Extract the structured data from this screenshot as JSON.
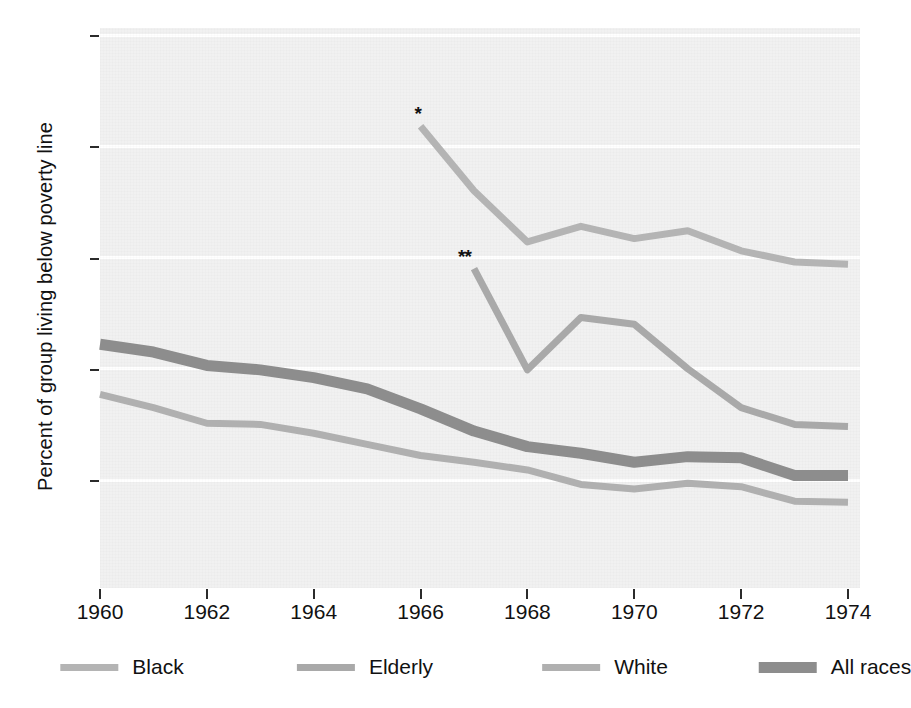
{
  "chart_data": {
    "type": "line",
    "title": "",
    "subtitle": "",
    "xlabel": "",
    "ylabel": "Percent of group living below poverty line",
    "xlim": [
      1960,
      1974
    ],
    "ylim": [
      0,
      50
    ],
    "grid": true,
    "grid_axis": "y",
    "legend_position": "bottom",
    "y_ticks": [
      10,
      20,
      30,
      40,
      50
    ],
    "y_tick_labels": [
      "10",
      "20",
      "30",
      "40",
      "50"
    ],
    "x_ticks": [
      1960,
      1962,
      1964,
      1966,
      1968,
      1970,
      1972,
      1974
    ],
    "x_tick_labels": [
      "1960",
      "1962",
      "1964",
      "1966",
      "1968",
      "1970",
      "1972",
      "1974"
    ],
    "annotations": [
      {
        "text": "*",
        "x": 1966,
        "y": 41.8,
        "note": "start of Black series"
      },
      {
        "text": "**",
        "x": 1967,
        "y": 29.0,
        "note": "start of Elderly series"
      }
    ],
    "series": [
      {
        "name": "Black",
        "color": "#b4b4b4",
        "width": 7,
        "x": [
          1966,
          1967,
          1968,
          1969,
          1970,
          1971,
          1972,
          1973,
          1974
        ],
        "values": [
          41.8,
          36.0,
          31.4,
          32.8,
          31.7,
          32.4,
          30.6,
          29.6,
          29.4
        ]
      },
      {
        "name": "Elderly",
        "color": "#a9a9a9",
        "width": 7,
        "x": [
          1967,
          1968,
          1969,
          1970,
          1971,
          1972,
          1973,
          1974
        ],
        "values": [
          29.0,
          19.9,
          24.6,
          24.0,
          20.0,
          16.5,
          15.0,
          14.8
        ]
      },
      {
        "name": "White",
        "color": "#b0b0b0",
        "width": 7,
        "x": [
          1960,
          1961,
          1962,
          1963,
          1964,
          1965,
          1966,
          1967,
          1968,
          1969,
          1970,
          1971,
          1972,
          1973,
          1974
        ],
        "values": [
          17.7,
          16.5,
          15.1,
          15.0,
          14.2,
          13.2,
          12.2,
          11.6,
          10.9,
          9.6,
          9.2,
          9.7,
          9.4,
          8.1,
          8.0
        ]
      },
      {
        "name": "All races",
        "color": "#8d8d8d",
        "width": 11,
        "x": [
          1960,
          1961,
          1962,
          1963,
          1964,
          1965,
          1966,
          1967,
          1968,
          1969,
          1970,
          1971,
          1972,
          1973,
          1974
        ],
        "values": [
          22.2,
          21.5,
          20.3,
          19.9,
          19.2,
          18.2,
          16.4,
          14.4,
          13.0,
          12.4,
          11.6,
          12.1,
          12.0,
          10.4,
          10.4
        ]
      }
    ],
    "legend": [
      {
        "label": "Black",
        "color": "#b4b4b4",
        "thickness": 7
      },
      {
        "label": "Elderly",
        "color": "#a9a9a9",
        "thickness": 7
      },
      {
        "label": "White",
        "color": "#b0b0b0",
        "thickness": 7
      },
      {
        "label": "All races",
        "color": "#8d8d8d",
        "thickness": 11
      }
    ],
    "plot_background": "#f1f1f1",
    "gridline_color": "#ffffff"
  }
}
